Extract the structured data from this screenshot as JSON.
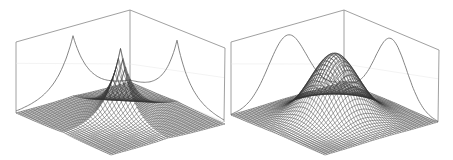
{
  "figure": {
    "panels": [
      {
        "id": "left",
        "kind": "3d-surface",
        "shape": "sharp-cusp peak (Laplace/exponential-like)",
        "sharpness": 0.55,
        "box": {
          "tl": [
            16,
            42
          ],
          "tb": [
            130,
            10
          ],
          "tr": [
            225,
            48
          ],
          "bl": [
            16,
            113
          ],
          "bb": [
            130,
            82
          ],
          "br": [
            224,
            122
          ],
          "bf": [
            111,
            155
          ]
        },
        "peak_height": 70,
        "projection_curves": "cusp-shaped marginals on both back walls"
      },
      {
        "id": "right",
        "kind": "3d-surface",
        "shape": "smooth bell peak (Gaussian-like)",
        "sharpness": 0,
        "box": {
          "tl": [
            231,
            42
          ],
          "tb": [
            344,
            10
          ],
          "tr": [
            439,
            50
          ],
          "bl": [
            231,
            115
          ],
          "bb": [
            344,
            82
          ],
          "br": [
            438,
            122
          ],
          "bf": [
            325,
            155
          ]
        },
        "peak_height": 65,
        "projection_curves": "bell-shaped marginals on both back walls"
      }
    ],
    "colors": {
      "mesh": "#333333",
      "box": "#888888",
      "curve": "#777777",
      "background": "#ffffff"
    }
  }
}
